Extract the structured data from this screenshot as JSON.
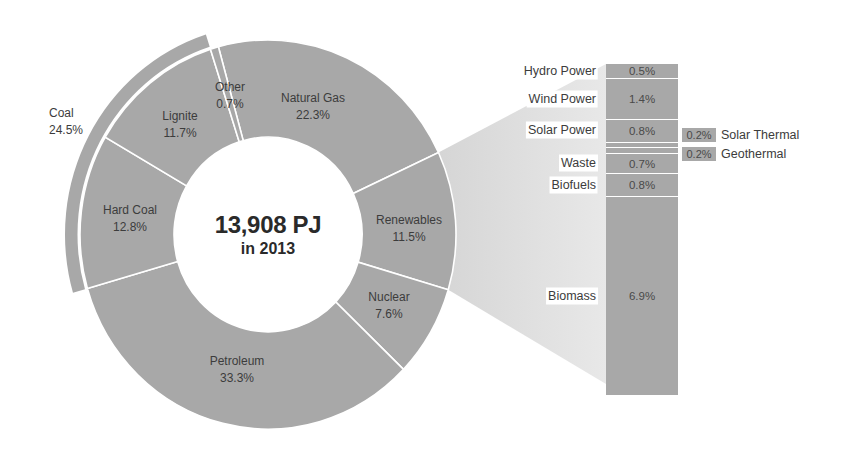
{
  "chart_data": {
    "type": "pie",
    "subtype": "donut with bar-of-pie breakdown",
    "title": "13,908 PJ",
    "subtitle": "in 2013",
    "unit": "%",
    "slices": [
      {
        "label": "Natural Gas",
        "value": 22.3,
        "display": "22.3%",
        "label_x": 313,
        "label_y": 107
      },
      {
        "label": "Renewables",
        "value": 11.5,
        "display": "11.5%",
        "label_x": 409,
        "label_y": 229
      },
      {
        "label": "Nuclear",
        "value": 7.6,
        "display": "7.6%",
        "label_x": 389,
        "label_y": 306
      },
      {
        "label": "Petroleum",
        "value": 33.3,
        "display": "33.3%",
        "label_x": 237,
        "label_y": 370
      },
      {
        "label": "Hard Coal",
        "value": 12.8,
        "display": "12.8%",
        "label_x": 130,
        "label_y": 219
      },
      {
        "label": "Lignite",
        "value": 11.7,
        "display": "11.7%",
        "label_x": 180,
        "label_y": 125
      },
      {
        "label": "Other",
        "value": 0.7,
        "display": "0.7%",
        "label_x": 230,
        "label_y": 96
      }
    ],
    "group": {
      "label": "Coal",
      "value": 24.5,
      "display": "24.5%",
      "members": [
        "Hard Coal",
        "Lignite"
      ],
      "label_x": 49,
      "label_y": 122
    },
    "breakdown": {
      "of": "Renewables",
      "total": 11.5,
      "items": [
        {
          "label": "Hydro Power",
          "value": 0.5,
          "display": "0.5%"
        },
        {
          "label": "Wind Power",
          "value": 1.4,
          "display": "1.4%"
        },
        {
          "label": "Solar Power",
          "value": 0.8,
          "display": "0.8%"
        },
        {
          "label": "Solar Thermal",
          "value": 0.2,
          "display": "0.2%",
          "callout": true
        },
        {
          "label": "Geothermal",
          "value": 0.2,
          "display": "0.2%",
          "callout": true
        },
        {
          "label": "Waste",
          "value": 0.7,
          "display": "0.7%"
        },
        {
          "label": "Biofuels",
          "value": 0.8,
          "display": "0.8%"
        },
        {
          "label": "Biomass",
          "value": 6.9,
          "display": "6.9%"
        }
      ]
    },
    "colors": {
      "slice": "#a8a8a8",
      "separator": "#ffffff",
      "wedge_start": "#d2d2d2",
      "wedge_end": "#e8e8e8",
      "text": "#3c3c3c"
    },
    "layout": {
      "center": [
        268,
        234.5
      ],
      "y_scale": 1.035,
      "outer_r": 188,
      "inner_r": 94,
      "band_inner_r": 190.5,
      "band_outer_r": 203,
      "start_angle": 344.7,
      "center_text_y": 235,
      "bar": {
        "x": 606,
        "y": 64,
        "w": 72,
        "h": 331
      },
      "bar_label_gap": 8,
      "wedge_bottom_y": 384,
      "callout_x": 682,
      "callout_w": 34,
      "callout_h": 14,
      "callout_tops": [
        128,
        147
      ]
    }
  }
}
